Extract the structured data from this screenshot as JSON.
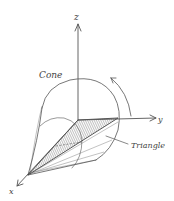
{
  "diagram": {
    "type": "3d-solid-of-revolution-sketch",
    "axes": {
      "z": {
        "label": "z"
      },
      "y": {
        "label": "y"
      },
      "x": {
        "label": "x"
      }
    },
    "labels": {
      "cone": "Cone",
      "triangle": "Triangle"
    },
    "elements": [
      {
        "name": "z-axis",
        "kind": "arrow"
      },
      {
        "name": "y-axis",
        "kind": "arrow"
      },
      {
        "name": "x-axis",
        "kind": "arrow"
      },
      {
        "name": "cone-outline",
        "kind": "curve"
      },
      {
        "name": "triangle",
        "kind": "shaded-polygon"
      },
      {
        "name": "rotation-arrow",
        "kind": "curved-arrow",
        "direction": "counter-clockwise about z"
      }
    ],
    "colors": {
      "ink": "#555555",
      "shade": "#9a9a9a",
      "background": "#ffffff"
    }
  }
}
